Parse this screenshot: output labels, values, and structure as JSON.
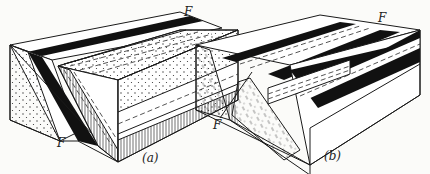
{
  "figure": {
    "panels": [
      {
        "id": "a",
        "caption": "(a)",
        "fault_labels": [
          "F",
          "F"
        ]
      },
      {
        "id": "b",
        "caption": "(b)",
        "fault_labels": [
          "F",
          "F"
        ]
      }
    ]
  },
  "colors": {
    "ink": "#1a1a1a",
    "paper": "#fbfbf9",
    "bed_black": "#111111"
  }
}
